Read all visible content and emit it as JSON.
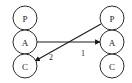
{
  "diagram": {
    "type": "node-link-graph",
    "canvas": {
      "width": 132,
      "height": 83,
      "background": "#ffffff"
    },
    "stroke_color": "#1a1a1a",
    "node_fill": "#ffffff",
    "node_stroke": "#2b2b2b",
    "columns": [
      {
        "name": "left-column",
        "cx": 25,
        "nodes": [
          {
            "id": "left-p",
            "label": "P",
            "cx": 25,
            "cy": 18,
            "r": 12
          },
          {
            "id": "left-a",
            "label": "A",
            "cx": 25,
            "cy": 42,
            "r": 12
          },
          {
            "id": "left-c",
            "label": "C",
            "cx": 25,
            "cy": 66,
            "r": 12
          }
        ]
      },
      {
        "name": "right-column",
        "cx": 112,
        "nodes": [
          {
            "id": "right-p",
            "label": "P",
            "cx": 112,
            "cy": 18,
            "r": 12
          },
          {
            "id": "right-a",
            "label": "A",
            "cx": 112,
            "cy": 42,
            "r": 12
          },
          {
            "id": "right-c",
            "label": "C",
            "cx": 112,
            "cy": 66,
            "r": 12
          }
        ]
      }
    ],
    "edges": [
      {
        "id": "edge-1",
        "label": "1",
        "from": "left-a",
        "to": "right-a",
        "from_point": [
          37,
          42
        ],
        "to_point": [
          100,
          42
        ],
        "label_point": [
          83,
          53
        ],
        "arrowhead": "end"
      },
      {
        "id": "edge-2",
        "label": "2",
        "from": "right-p",
        "to": "left-c",
        "from_point": [
          101,
          24
        ],
        "to_point": [
          35,
          61
        ],
        "label_point": [
          51,
          57
        ],
        "arrowhead": "end"
      }
    ]
  }
}
